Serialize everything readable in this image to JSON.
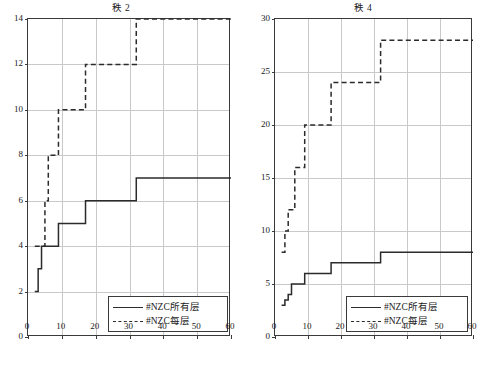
{
  "figure": {
    "background": "#ffffff",
    "line_color": "#2b2b2b",
    "grid_color": "#c9c9c9",
    "axis_color": "#3a3a3a"
  },
  "legend": {
    "solid_label": "#NZC所有层",
    "dashed_label": "#NZC每层"
  },
  "chart_data": [
    {
      "type": "line",
      "title": "秩 2",
      "xlabel": "",
      "ylabel": "",
      "xlim": [
        0,
        60
      ],
      "ylim": [
        0,
        14
      ],
      "xticks": [
        0,
        10,
        20,
        30,
        40,
        50,
        60
      ],
      "yticks": [
        0,
        2,
        4,
        6,
        8,
        10,
        12,
        14
      ],
      "xtick_labels": [
        "0",
        "10",
        "20",
        "30",
        "40",
        "50",
        "60"
      ],
      "ytick_labels": [
        "0",
        "2",
        "4",
        "6",
        "8",
        "10",
        "12",
        "14"
      ],
      "grid": true,
      "legend_position": "lower right",
      "drawstyle": "steps-post",
      "series": [
        {
          "name": "#NZC所有层",
          "style": "solid",
          "x": [
            2,
            3,
            4,
            6,
            8,
            9,
            10,
            16,
            17,
            31,
            32,
            60
          ],
          "values": [
            2,
            3,
            4,
            4,
            4,
            5,
            5,
            5,
            6,
            6,
            7,
            7
          ]
        },
        {
          "name": "#NZC每层",
          "style": "dashed",
          "x": [
            2,
            3,
            5,
            6,
            8,
            9,
            15,
            16,
            17,
            31,
            32,
            60
          ],
          "values": [
            4,
            4,
            6,
            8,
            8,
            10,
            10,
            10,
            12,
            12,
            14,
            14
          ]
        }
      ]
    },
    {
      "type": "line",
      "title": "秩 4",
      "xlabel": "",
      "ylabel": "",
      "xlim": [
        0,
        60
      ],
      "ylim": [
        0,
        30
      ],
      "xticks": [
        0,
        10,
        20,
        30,
        40,
        50,
        60
      ],
      "yticks": [
        0,
        5,
        10,
        15,
        20,
        25,
        30
      ],
      "xtick_labels": [
        "0",
        "10",
        "20",
        "30",
        "40",
        "50",
        "60"
      ],
      "ytick_labels": [
        "0",
        "5",
        "10",
        "15",
        "20",
        "25",
        "30"
      ],
      "grid": true,
      "legend_position": "lower right",
      "drawstyle": "steps-post",
      "series": [
        {
          "name": "#NZC所有层",
          "style": "solid",
          "x": [
            2,
            3,
            4,
            5,
            6,
            8,
            9,
            16,
            17,
            31,
            32,
            60
          ],
          "values": [
            3,
            3.5,
            4,
            5,
            5,
            5,
            6,
            6,
            7,
            7,
            8,
            8
          ]
        },
        {
          "name": "#NZC每层",
          "style": "dashed",
          "x": [
            2,
            3,
            4,
            5,
            6,
            8,
            9,
            15,
            16,
            17,
            31,
            32,
            60
          ],
          "values": [
            8,
            10,
            12,
            12,
            16,
            16,
            20,
            20,
            20,
            24,
            24,
            28,
            28
          ]
        }
      ]
    }
  ]
}
